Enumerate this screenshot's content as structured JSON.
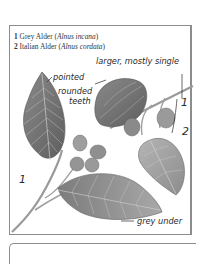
{
  "legend": {
    "items": [
      {
        "number": "1",
        "common_name": "Grey Alder",
        "open": " (",
        "scientific_name": "Alnus incana",
        "close": ")"
      },
      {
        "number": "2",
        "common_name": "Italian Alder",
        "open": " (",
        "scientific_name": "Alnus cordata",
        "close": ")"
      }
    ]
  },
  "annotations": {
    "pointed": "pointed",
    "rounded_teeth_line1": "rounded",
    "rounded_teeth_line2": "teeth",
    "larger_single": "larger, mostly single",
    "grey_under": "grey under"
  },
  "species_markers": {
    "species1_upper": "1",
    "species1_lower": "1",
    "species2": "2"
  },
  "colors": {
    "frame": "#8c8c8c",
    "leaf_dark": "#6e6e6e",
    "leaf_mid": "#9a9a9a",
    "leaf_light": "#bdbdbd",
    "text": "#2a2a2a"
  }
}
